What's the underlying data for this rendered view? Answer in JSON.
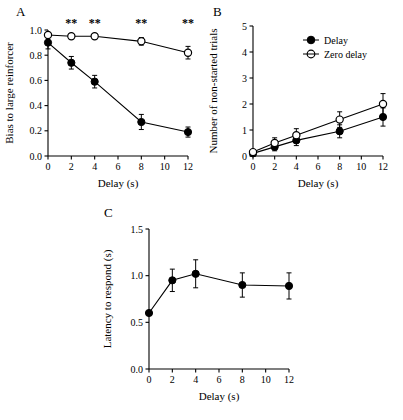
{
  "figure": {
    "panels": [
      {
        "letter": "A"
      },
      {
        "letter": "B"
      },
      {
        "letter": "C"
      }
    ]
  },
  "chart_data": [
    {
      "type": "line",
      "panel": "A",
      "title": "",
      "xlabel": "Delay (s)",
      "ylabel": "Bias to large reinforcer",
      "x": [
        0,
        2,
        4,
        8,
        12
      ],
      "xlim": [
        0,
        12
      ],
      "ylim": [
        0.0,
        1.0
      ],
      "xticks": [
        0,
        2,
        4,
        6,
        8,
        10,
        12
      ],
      "xticklabels": [
        "0",
        "2",
        "4",
        "6",
        "8",
        "10",
        "12"
      ],
      "yticks": [
        0.0,
        0.2,
        0.4,
        0.6,
        0.8,
        1.0
      ],
      "yticklabels": [
        "0.0",
        "0.2",
        "0.4",
        "0.6",
        "0.8",
        "1.0"
      ],
      "grid": false,
      "legend": "none",
      "series": [
        {
          "name": "Delay",
          "marker": "filled-circle",
          "values": [
            0.9,
            0.74,
            0.59,
            0.27,
            0.19
          ],
          "errors": [
            0.05,
            0.05,
            0.05,
            0.06,
            0.04
          ]
        },
        {
          "name": "Zero delay",
          "marker": "open-circle",
          "values": [
            0.96,
            0.95,
            0.95,
            0.91,
            0.82
          ],
          "errors": [
            0.02,
            0.02,
            0.02,
            0.03,
            0.05
          ]
        }
      ],
      "annotations": [
        {
          "text": "**",
          "x": 2
        },
        {
          "text": "**",
          "x": 4
        },
        {
          "text": "**",
          "x": 8
        },
        {
          "text": "**",
          "x": 12
        }
      ]
    },
    {
      "type": "line",
      "panel": "B",
      "title": "",
      "xlabel": "Delay (s)",
      "ylabel": "Number of non-started trials",
      "x": [
        0,
        2,
        4,
        8,
        12
      ],
      "xlim": [
        0,
        12
      ],
      "ylim": [
        0,
        5
      ],
      "xticks": [
        0,
        2,
        4,
        6,
        8,
        10,
        12
      ],
      "xticklabels": [
        "0",
        "2",
        "4",
        "6",
        "8",
        "10",
        "12"
      ],
      "yticks": [
        0,
        1,
        2,
        3,
        4,
        5
      ],
      "yticklabels": [
        "0",
        "1",
        "2",
        "3",
        "4",
        "5"
      ],
      "grid": false,
      "legend": "upper right",
      "series": [
        {
          "name": "Delay",
          "marker": "filled-circle",
          "values": [
            0.1,
            0.35,
            0.6,
            0.95,
            1.5
          ],
          "errors": [
            0.1,
            0.15,
            0.2,
            0.25,
            0.35
          ]
        },
        {
          "name": "Zero delay",
          "marker": "open-circle",
          "values": [
            0.15,
            0.5,
            0.8,
            1.4,
            2.0
          ],
          "errors": [
            0.1,
            0.2,
            0.25,
            0.3,
            0.4
          ]
        }
      ]
    },
    {
      "type": "line",
      "panel": "C",
      "title": "",
      "xlabel": "Delay (s)",
      "ylabel": "Latency to respond (s)",
      "x": [
        0,
        2,
        4,
        8,
        12
      ],
      "xlim": [
        0,
        12
      ],
      "ylim": [
        0.0,
        1.5
      ],
      "xticks": [
        0,
        2,
        4,
        6,
        8,
        10,
        12
      ],
      "xticklabels": [
        "0",
        "2",
        "4",
        "6",
        "8",
        "10",
        "12"
      ],
      "yticks": [
        0.0,
        0.5,
        1.0,
        1.5
      ],
      "yticklabels": [
        "0.0",
        "0.5",
        "1.0",
        "1.5"
      ],
      "grid": false,
      "legend": "none",
      "series": [
        {
          "name": "Latency",
          "marker": "filled-circle",
          "values": [
            0.6,
            0.95,
            1.02,
            0.9,
            0.89
          ],
          "errors": [
            0.0,
            0.12,
            0.15,
            0.13,
            0.14
          ]
        }
      ]
    }
  ],
  "legend": {
    "panelB": [
      {
        "label": "Delay",
        "marker": "filled-circle"
      },
      {
        "label": "Zero delay",
        "marker": "open-circle"
      }
    ]
  },
  "labels": {
    "panelA_letter": "A",
    "panelB_letter": "B",
    "panelC_letter": "C",
    "panelA_ylabel": "Bias to large reinforcer",
    "panelA_xlabel": "Delay (s)",
    "panelB_ylabel": "Number of non-started trials",
    "panelB_xlabel": "Delay (s)",
    "panelC_ylabel": "Latency to respond (s)",
    "panelC_xlabel": "Delay (s)"
  }
}
